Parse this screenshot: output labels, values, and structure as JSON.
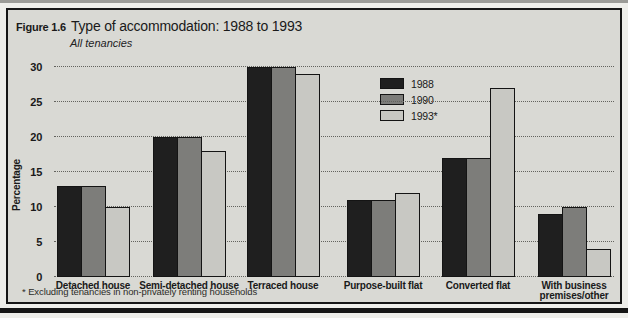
{
  "figure": {
    "label": "Figure 1.6",
    "title": "Type of accommodation: 1988 to 1993",
    "subtitle": "All tenancies",
    "footnote": "* Excluding tenancies in non-privately renting households"
  },
  "chart_data": {
    "type": "bar",
    "title": "Type of accommodation: 1988 to 1993",
    "subtitle": "All tenancies",
    "xlabel": "",
    "ylabel": "Percentage",
    "ylim": [
      0,
      30
    ],
    "yticks": [
      0,
      5,
      10,
      15,
      20,
      25,
      30
    ],
    "grid": "horizontal-dotted",
    "legend_position": "top-center",
    "categories": [
      "Detached house",
      "Semi-detached house",
      "Terraced house",
      "Purpose-built flat",
      "Converted flat",
      "With business premises/other"
    ],
    "series": [
      {
        "name": "1988",
        "color": "#1f1f1f",
        "values": [
          13,
          20,
          30,
          11,
          17,
          9
        ]
      },
      {
        "name": "1990",
        "color": "#7d7d7a",
        "values": [
          13,
          20,
          30,
          11,
          17,
          10
        ]
      },
      {
        "name": "1993*",
        "color": "#c8c8c3",
        "values": [
          10,
          18,
          29,
          12,
          27,
          4
        ]
      }
    ]
  },
  "colors": {
    "figure_background": "#d9d9d4",
    "frame_border": "#161616",
    "gridline": "#63635e",
    "text": "#1a1a1a"
  }
}
